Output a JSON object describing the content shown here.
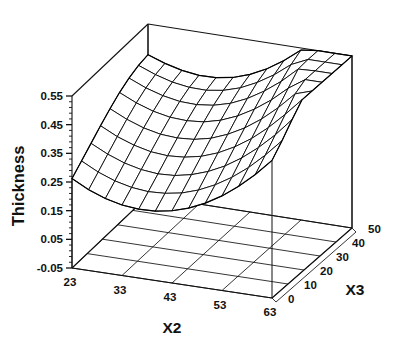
{
  "chart_data": {
    "type": "surface",
    "title": "",
    "subtitle": "",
    "xlabel": "X2",
    "ylabel": "X3",
    "zlabel": "Thickness",
    "grid": true,
    "legend": "none",
    "background_color": "#ffffff",
    "line_color": "#000000",
    "x_ticks": [
      23,
      33,
      43,
      53,
      63
    ],
    "x_tick_labels": [
      "23",
      "33",
      "43",
      "53",
      "63"
    ],
    "xlim": [
      23,
      63
    ],
    "y_ticks": [
      0,
      10,
      20,
      30,
      40,
      50
    ],
    "y_tick_labels": [
      "0",
      "10",
      "20",
      "30",
      "40",
      "50"
    ],
    "ylim": [
      0,
      50
    ],
    "z_ticks": [
      -0.05,
      0.05,
      0.15,
      0.25,
      0.35,
      0.45,
      0.55
    ],
    "z_tick_labels": [
      "-0.05",
      "0.05",
      "0.15",
      "0.25",
      "0.35",
      "0.45",
      "0.55"
    ],
    "zlim": [
      -0.05,
      0.55
    ],
    "z_minor_ticks_per_interval": 4,
    "floor_grid_x_divisions": 4,
    "floor_grid_y_divisions": 5,
    "mesh_nx": 13,
    "mesh_ny": 9,
    "surface_description": "Saddle / curved valley surface: thickness is high along the X2 edges and at high X3, dipping to a minimum in the mid-X2 low-X3 region.",
    "x_values": [
      23,
      26.33,
      29.67,
      33,
      36.33,
      39.67,
      43,
      46.33,
      49.67,
      53,
      56.33,
      59.67,
      63
    ],
    "y_values": [
      0,
      6.25,
      12.5,
      18.75,
      25,
      31.25,
      37.5,
      43.75,
      50
    ],
    "z_matrix": [
      [
        0.262,
        0.292,
        0.322,
        0.352,
        0.38,
        0.405,
        0.424,
        0.437,
        0.443
      ],
      [
        0.232,
        0.262,
        0.293,
        0.323,
        0.352,
        0.378,
        0.399,
        0.414,
        0.422
      ],
      [
        0.21,
        0.24,
        0.271,
        0.302,
        0.331,
        0.358,
        0.381,
        0.397,
        0.407
      ],
      [
        0.196,
        0.226,
        0.257,
        0.288,
        0.318,
        0.346,
        0.37,
        0.388,
        0.399
      ],
      [
        0.19,
        0.22,
        0.251,
        0.283,
        0.314,
        0.343,
        0.368,
        0.387,
        0.4
      ],
      [
        0.192,
        0.223,
        0.254,
        0.287,
        0.318,
        0.348,
        0.375,
        0.396,
        0.41
      ],
      [
        0.202,
        0.233,
        0.266,
        0.299,
        0.331,
        0.363,
        0.391,
        0.414,
        0.43
      ],
      [
        0.22,
        0.252,
        0.286,
        0.32,
        0.354,
        0.387,
        0.417,
        0.442,
        0.459
      ],
      [
        0.246,
        0.279,
        0.314,
        0.35,
        0.385,
        0.42,
        0.452,
        0.478,
        0.497
      ],
      [
        0.28,
        0.314,
        0.351,
        0.388,
        0.425,
        0.461,
        0.495,
        0.523,
        0.543
      ],
      [
        0.322,
        0.357,
        0.396,
        0.435,
        0.474,
        0.511,
        0.547,
        0.576,
        0.598
      ],
      [
        0.372,
        0.409,
        0.449,
        0.49,
        0.531,
        0.57,
        0.607,
        0.638,
        0.661
      ],
      [
        0.43,
        0.468,
        0.511,
        0.554,
        0.596,
        0.637,
        0.676,
        0.709,
        0.733
      ]
    ]
  },
  "axes": {
    "z_title": "Thickness",
    "x_title": "X2",
    "y_title": "X3"
  },
  "labels": {
    "z": [
      "0.55",
      "0.45",
      "0.35",
      "0.25",
      "0.15",
      "0.05",
      "-0.05"
    ],
    "x": [
      "23",
      "33",
      "43",
      "53",
      "63"
    ],
    "y": [
      "50",
      "40",
      "30",
      "20",
      "10",
      "0"
    ]
  }
}
